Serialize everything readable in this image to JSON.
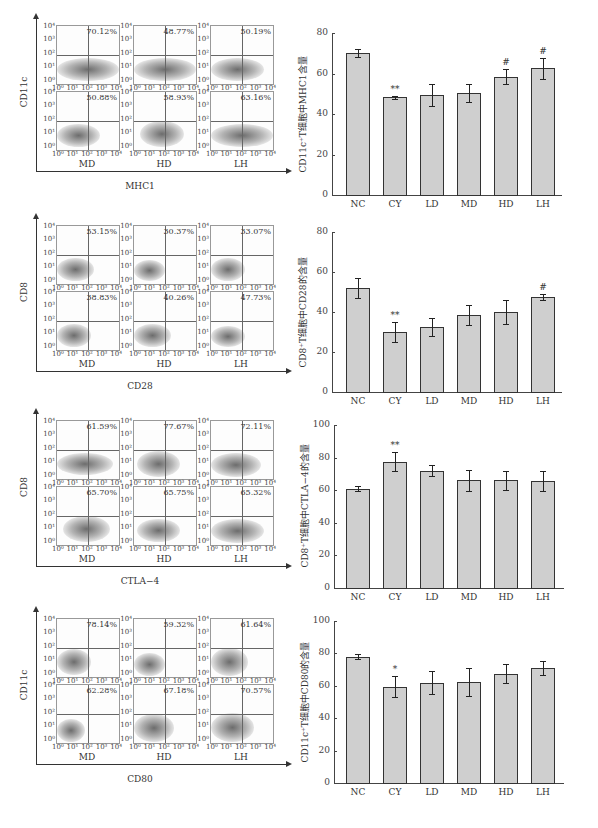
{
  "groups": [
    "NC",
    "CY",
    "LD",
    "MD",
    "HD",
    "LH"
  ],
  "flow_axis_ticks": [
    "10⁰",
    "10¹",
    "10²",
    "10³",
    "10⁴"
  ],
  "flow_sections": [
    {
      "y_axis_title": "CD11c",
      "x_axis_title": "MHC1",
      "percentages": [
        "70.12%",
        "48.77%",
        "50.19%",
        "50.88%",
        "58.93%",
        "63.16%"
      ]
    },
    {
      "y_axis_title": "CD8",
      "x_axis_title": "CD28",
      "percentages": [
        "53.15%",
        "30.37%",
        "33.07%",
        "38.83%",
        "40.26%",
        "47.73%"
      ]
    },
    {
      "y_axis_title": "CD8",
      "x_axis_title": "CTLA−4",
      "percentages": [
        "61.59%",
        "77.67%",
        "72.11%",
        "65.70%",
        "65.75%",
        "65.32%"
      ]
    },
    {
      "y_axis_title": "CD11c",
      "x_axis_title": "CD80",
      "percentages": [
        "78.14%",
        "59.32%",
        "61.64%",
        "62.28%",
        "67.18%",
        "70.57%"
      ]
    }
  ],
  "chart_data": [
    {
      "type": "bar",
      "title": "",
      "categories": [
        "NC",
        "CY",
        "LD",
        "MD",
        "HD",
        "LH"
      ],
      "values": [
        70.1,
        48.2,
        49.5,
        50.5,
        58.5,
        62.5
      ],
      "errors": [
        2.0,
        0.8,
        5.5,
        4.5,
        3.5,
        5.0
      ],
      "annotations": [
        "",
        "**",
        "",
        "",
        "#",
        "#"
      ],
      "xlabel": "",
      "ylabel": "CD11c⁺T细胞中MHC1含量",
      "ylim": [
        0,
        80
      ],
      "yticks": [
        0,
        20,
        40,
        60,
        80
      ],
      "grid": false
    },
    {
      "type": "bar",
      "title": "",
      "categories": [
        "NC",
        "CY",
        "LD",
        "MD",
        "HD",
        "LH"
      ],
      "values": [
        52.0,
        30.2,
        32.5,
        38.5,
        40.0,
        47.3
      ],
      "errors": [
        5.0,
        5.0,
        4.5,
        5.0,
        6.0,
        1.5
      ],
      "annotations": [
        "",
        "**",
        "",
        "",
        "",
        "#"
      ],
      "xlabel": "",
      "ylabel": "CD8⁺T细胞中CD28的含量",
      "ylim": [
        0,
        80
      ],
      "yticks": [
        0,
        20,
        40,
        60,
        80
      ],
      "grid": false
    },
    {
      "type": "bar",
      "title": "",
      "categories": [
        "NC",
        "CY",
        "LD",
        "MD",
        "HD",
        "LH"
      ],
      "values": [
        61.0,
        77.5,
        72.0,
        66.0,
        66.0,
        65.5
      ],
      "errors": [
        1.5,
        6.0,
        3.5,
        6.5,
        6.0,
        6.0
      ],
      "annotations": [
        "",
        "**",
        "",
        "",
        "",
        ""
      ],
      "xlabel": "",
      "ylabel": "CD8⁺T细胞中CTLA−4的含量",
      "ylim": [
        0,
        100
      ],
      "yticks": [
        0,
        20,
        40,
        60,
        80,
        100
      ],
      "grid": false
    },
    {
      "type": "bar",
      "title": "",
      "categories": [
        "NC",
        "CY",
        "LD",
        "MD",
        "HD",
        "LH"
      ],
      "values": [
        78.0,
        59.5,
        62.0,
        62.5,
        67.5,
        71.0
      ],
      "errors": [
        1.5,
        6.5,
        7.0,
        8.5,
        6.0,
        4.5
      ],
      "annotations": [
        "",
        "*",
        "",
        "",
        "",
        ""
      ],
      "xlabel": "",
      "ylabel": "CD11c⁺T细胞中CD80的含量",
      "ylim": [
        0,
        100
      ],
      "yticks": [
        0,
        20,
        40,
        60,
        80,
        100
      ],
      "grid": false
    }
  ]
}
